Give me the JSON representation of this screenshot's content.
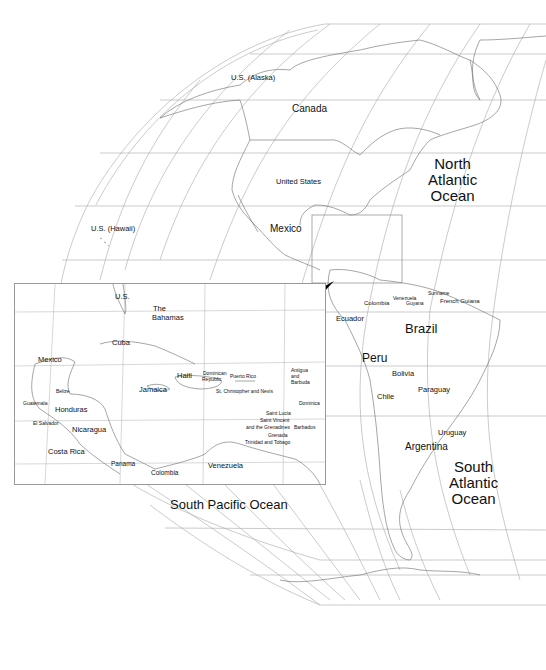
{
  "map": {
    "oceans": [
      {
        "id": "north-atlantic",
        "lines": [
          "North",
          "Atlantic",
          "Ocean"
        ]
      },
      {
        "id": "south-atlantic",
        "lines": [
          "South",
          "Atlantic",
          "Ocean"
        ]
      },
      {
        "id": "south-pacific",
        "label": "South Pacific Ocean"
      }
    ],
    "main_labels": {
      "alaska": "U.S. (Alaska)",
      "canada": "Canada",
      "united_states": "United States",
      "hawaii": "U.S. (Hawaii)",
      "mexico": "Mexico",
      "colombia": "Colombia",
      "venezuela": "Venezuela",
      "guyana": "Guyana",
      "suriname": "Suriname",
      "french_guiana": "French Guiana",
      "ecuador": "Ecuador",
      "brazil": "Brazil",
      "peru": "Peru",
      "bolivia": "Bolivia",
      "paraguay": "Paraguay",
      "chile": "Chile",
      "uruguay": "Uruguay",
      "argentina": "Argentina"
    },
    "inset_labels": {
      "us": "U.S.",
      "bahamas_1": "The",
      "bahamas_2": "Bahamas",
      "cuba": "Cuba",
      "mexico": "Mexico",
      "haiti": "Haiti",
      "dominican_1": "Dominican",
      "dominican_2": "Republic",
      "puerto_rico": "Puerto Rico",
      "antigua_1": "Antigua",
      "antigua_2": "and",
      "antigua_3": "Barbuda",
      "st_kitts": "St. Christopher and Nevis",
      "jamaica": "Jamaica",
      "belize": "Belize",
      "guatemala": "Guatemala",
      "honduras": "Honduras",
      "el_salvador": "El Salvador",
      "nicaragua": "Nicaragua",
      "dominica": "Dominica",
      "saint_lucia": "Saint Lucia",
      "saint_vincent_1": "Saint Vincent",
      "saint_vincent_2": "and the Grenadines",
      "barbados": "Barbados",
      "grenada": "Grenada",
      "trinidad": "Trinidad and Tobago",
      "costa_rica": "Costa Rica",
      "panama": "Panama",
      "colombia": "Colombia",
      "venezuela": "Venezuela"
    },
    "colors": {
      "line": "#9a9a9a",
      "coast": "#6a6a6a",
      "text": "#111111",
      "arrow": "#000000"
    }
  }
}
